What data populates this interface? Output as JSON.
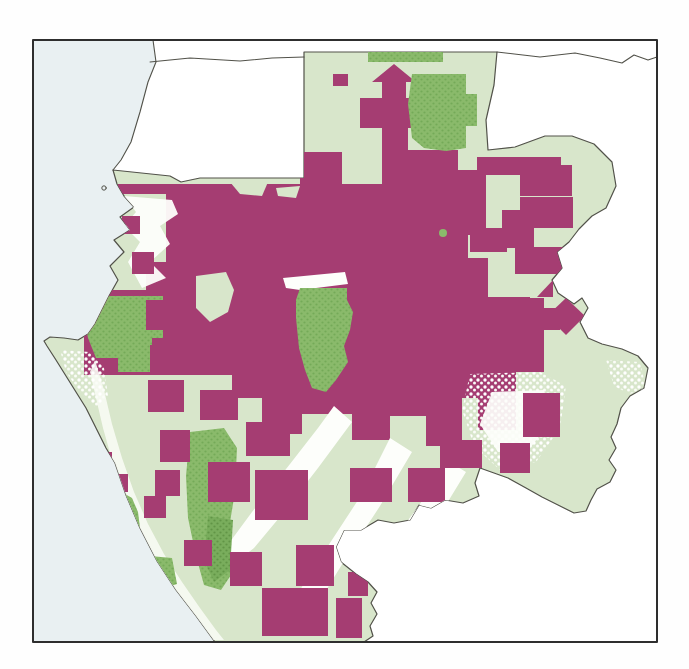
{
  "map": {
    "palette": {
      "page_background": "#fefefe",
      "ocean": "#e9f0f2",
      "neighbor_land": "#ffffff",
      "country_fill": "#d8e6cb",
      "concession_magenta": "#a53d72",
      "protected_green": "#8aba6b",
      "protected_green_dark": "#6fa356",
      "savanna_white": "#fdfefb",
      "border_line": "#52524a",
      "frame_line": "#2e2e2e"
    },
    "frame": {
      "x": 33,
      "y": 40,
      "w": 624,
      "h": 602
    },
    "country_outline": "113,170 170,176 181,182 200,178 304,178 304,52 497,52 494,85 486,120 488,150 515,147 545,136 572,136 594,144 612,162 616,186 606,208 592,216 579,229 569,242 557,252 562,268 552,280 558,293 574,304 582,298 588,308 580,322 588,338 602,344 622,349 638,356 648,368 644,388 630,396 621,408 617,424 611,437 616,448 609,460 616,470 610,482 597,489 591,500 586,511 574,513 558,505 542,497 526,488 508,478 494,473 480,468 475,483 479,496 463,503 445,500 431,508 419,505 410,520 394,523 378,520 361,530 344,530 336,547 341,562 356,574 368,582 377,592 371,603 377,614 370,626 373,636 364,642 215,642 196,616 176,590 157,561 140,528 126,495 115,463 106,448 96,428 86,408 76,392 66,376 56,360 47,346 44,341 50,337 64,338 78,340 88,334 95,324 101,312 109,296 118,280 110,266 124,252 114,240 130,230 120,217 134,207 124,196 117,184",
    "layers": [
      {
        "name": "ocean",
        "group": "base",
        "kind": "polygon",
        "fill": "#e9f0f2",
        "pts": "33,40 657,40 657,642 33,642"
      },
      {
        "name": "equatorial-guinea-land",
        "group": "base",
        "kind": "polygon",
        "fill": "#ffffff",
        "pts": "153,40 156,62 148,82 140,112 131,142 121,160 113,170 170,176 181,182 200,178 304,178 304,40"
      },
      {
        "name": "congo-cameroon-land",
        "group": "base",
        "kind": "polygon",
        "fill": "#ffffff",
        "pts": "304,40 657,40 657,642 364,642 373,636 370,626 377,614 371,603 377,592 368,582 356,574 341,562 336,547 344,530 361,530 378,520 394,523 410,520 419,505 431,508 445,500 463,503 479,496 475,483 480,468 494,473 508,478 526,488 542,497 558,505 574,513 586,511 591,500 597,489 610,482 616,470 609,460 616,448 611,437 617,424 621,408 630,396 644,388 648,368 638,356 622,349 602,344 588,338 580,322 588,308 582,298 574,304 558,293 552,280 562,268 557,252 569,242 579,229 592,216 606,208 616,186 612,162 594,144 572,136 545,136 515,147 488,150 486,120 494,85 497,52 304,52"
      },
      {
        "name": "gabon-landmass",
        "group": "base",
        "kind": "outline-polygon",
        "fill": "#d8e6cb",
        "stroke": "#52524a",
        "sw": 1.2
      },
      {
        "name": "concession-main-block",
        "group": "land",
        "kind": "polygon",
        "fill": "#a53d72",
        "pts": "118,184 300,184 300,152 342,152 342,184 406,184 406,150 458,150 458,170 486,170 486,235 468,235 468,258 488,258 488,298 544,298 544,372 516,372 516,430 478,430 478,398 462,398 462,446 426,446 426,416 390,416 390,440 352,440 352,414 302,414 302,434 262,434 262,398 232,398 232,375 84,375 84,290 146,290 146,262 166,262 166,194 118,194"
      },
      {
        "name": "concession-arrow-block",
        "group": "land",
        "kind": "polygon",
        "fill": "#a53d72",
        "pts": "360,98 382,98 382,82 372,82 394,64 416,82 406,82 406,98 426,98 426,128 408,128 408,184 382,184 382,128 360,128"
      },
      {
        "name": "forest-gap-patch",
        "group": "land",
        "kind": "polygon",
        "fill": "#d8e6cb",
        "pts": "196,276 226,272 234,290 228,312 210,322 196,308"
      },
      {
        "name": "forest-gap-patch",
        "group": "land",
        "kind": "polygon",
        "fill": "#d8e6cb",
        "pts": "230,182 268,182 262,196 240,194"
      },
      {
        "name": "forest-gap-patch",
        "group": "land",
        "kind": "polygon",
        "fill": "#d8e6cb",
        "pts": "276,188 300,186 296,198 278,196"
      },
      {
        "name": "savanna-white-patch",
        "group": "land",
        "kind": "polygon",
        "fill": "#fdfefb",
        "opacity": 0.95,
        "pts": "124,196 172,200 178,214 160,226 170,244 150,262 166,278 142,288 128,262 140,242 124,226 136,212"
      },
      {
        "name": "savanna-white-patch",
        "group": "land",
        "kind": "polygon",
        "fill": "#f8fbf4",
        "opacity": 0.9,
        "pts": "95,360 104,390 112,424 122,458 134,492 148,524 164,554 182,582 200,608 216,630 224,640 210,640 192,614 172,587 153,556 137,524 123,492 112,460 103,428 96,398 90,372"
      },
      {
        "name": "savanna-white-patch",
        "group": "land",
        "kind": "polygon",
        "fill": "url(#patSpeck)",
        "pts": "60,350 90,352 104,368 108,396 96,408 80,392 66,372"
      },
      {
        "name": "savanna-white-band",
        "group": "land",
        "kind": "polygon",
        "fill": "#fdfefb",
        "pts": "334,406 352,422 318,468 284,512 254,548 236,562 224,550 252,512 290,464 318,428"
      },
      {
        "name": "savanna-white-band",
        "group": "land",
        "kind": "polygon",
        "fill": "#fdfefb",
        "pts": "390,438 412,452 380,506 346,558 320,600 300,590 328,546 362,494"
      },
      {
        "name": "savanna-white-band",
        "group": "land",
        "kind": "polygon",
        "fill": "#fdfefb",
        "pts": "446,460 466,472 438,518 410,552 392,542 420,504"
      },
      {
        "name": "savanna-white-patch",
        "group": "land",
        "kind": "polygon",
        "fill": "url(#patSpeck)",
        "pts": "470,374 540,372 566,386 560,428 536,462 500,470 474,446 462,410"
      },
      {
        "name": "savanna-white-patch",
        "group": "land",
        "kind": "polygon",
        "fill": "#fdfefb",
        "opacity": 0.92,
        "pts": "492,392 544,390 552,420 530,448 498,452 480,424"
      },
      {
        "name": "savanna-white-sliver",
        "group": "land",
        "kind": "polygon",
        "fill": "#fdfefb",
        "pts": "283,278 345,272 348,284 300,290 286,288"
      },
      {
        "name": "savanna-white-patch",
        "group": "land",
        "kind": "polygon",
        "fill": "url(#patSpeck)",
        "pts": "606,360 640,362 646,388 630,394 614,386"
      },
      {
        "name": "protected-area-northwest",
        "group": "land",
        "kind": "polygon",
        "fill": "url(#patGreen)",
        "pts": "84,296 163,296 163,345 150,345 150,372 118,372 118,358 96,358 88,338 84,318"
      },
      {
        "name": "protected-area-coastal",
        "group": "land",
        "kind": "polygon",
        "fill": "url(#patGreen)",
        "pts": "118,490 132,498 138,512 140,528 130,534 122,520 116,504"
      },
      {
        "name": "protected-area-coastal",
        "group": "land",
        "kind": "polygon",
        "fill": "url(#patGreen)",
        "pts": "150,556 172,558 177,584 158,590"
      },
      {
        "name": "protected-area-north",
        "group": "land",
        "kind": "polygon",
        "fill": "url(#patGreen)",
        "pts": "412,74 466,74 466,94 477,94 477,126 466,126 466,148 446,151 424,148 412,138 408,104"
      },
      {
        "name": "protected-area-north-strip",
        "group": "land",
        "kind": "polygon",
        "fill": "url(#patGreen)",
        "pts": "368,48 443,48 443,62 368,62"
      },
      {
        "name": "protected-area-center",
        "group": "land",
        "kind": "polygon",
        "fill": "url(#patGreen)",
        "pts": "300,288 347,288 347,300 353,312 350,330 344,346 348,362 336,380 326,392 312,388 305,370 299,348 296,318 296,300"
      },
      {
        "name": "protected-area-south",
        "group": "land",
        "kind": "polygon",
        "fill": "url(#patGreen)",
        "pts": "190,432 224,428 237,448 235,492 227,540 233,572 221,590 204,585 196,556 188,518 186,476"
      },
      {
        "name": "protected-area-south-core",
        "group": "land",
        "kind": "polygon",
        "fill": "url(#patGreenDk)",
        "pts": "208,516 233,520 230,570 214,582 204,560"
      },
      {
        "name": "protected-area-dot",
        "group": "land",
        "kind": "circle",
        "fill": "#8aba6b",
        "cx": 443,
        "cy": 233,
        "r": 4
      },
      {
        "name": "concession-block",
        "group": "land",
        "kind": "polygon",
        "fill": "#a53d72",
        "pts": "122,216 140,216 140,234 122,234"
      },
      {
        "name": "concession-block",
        "group": "land",
        "kind": "polygon",
        "fill": "#a53d72",
        "pts": "132,252 154,252 154,274 132,274"
      },
      {
        "name": "concession-block",
        "group": "land",
        "kind": "polygon",
        "fill": "#a53d72",
        "pts": "146,300 174,300 174,330 146,330"
      },
      {
        "name": "concession-block",
        "group": "land",
        "kind": "polygon",
        "fill": "#a53d72",
        "pts": "152,338 180,338 180,362 152,362"
      },
      {
        "name": "concession-block",
        "group": "land",
        "kind": "polygon",
        "fill": "#a53d72",
        "pts": "333,74 348,74 348,86 333,86"
      },
      {
        "name": "concession-block",
        "group": "land",
        "kind": "polygon",
        "fill": "#a53d72",
        "pts": "477,157 561,157 561,175 477,175"
      },
      {
        "name": "concession-block",
        "group": "land",
        "kind": "polygon",
        "fill": "#a53d72",
        "pts": "520,165 572,165 572,196 520,196"
      },
      {
        "name": "concession-block",
        "group": "land",
        "kind": "polygon",
        "fill": "#a53d72",
        "pts": "520,197 573,197 573,228 520,228"
      },
      {
        "name": "concession-block",
        "group": "land",
        "kind": "polygon",
        "fill": "#a53d72",
        "pts": "502,210 534,210 534,248 502,248"
      },
      {
        "name": "concession-block",
        "group": "land",
        "kind": "polygon",
        "fill": "#a53d72",
        "pts": "470,228 507,228 507,252 470,252"
      },
      {
        "name": "concession-block",
        "group": "land",
        "kind": "polygon",
        "fill": "#a53d72",
        "pts": "515,247 570,247 570,274 515,274"
      },
      {
        "name": "concession-block",
        "group": "land",
        "kind": "polygon",
        "fill": "#a53d72",
        "pts": "566,298 585,316 566,335 547,316"
      },
      {
        "name": "concession-block",
        "group": "land",
        "kind": "polygon",
        "fill": "#a53d72",
        "pts": "537,297 553,280 553,297"
      },
      {
        "name": "concession-block",
        "group": "land",
        "kind": "polygon",
        "fill": "#a53d72",
        "pts": "470,297 530,297 530,308 560,308 560,330 540,330 540,350 470,350"
      },
      {
        "name": "concession-block",
        "group": "land",
        "kind": "polygon",
        "fill": "#a53d72",
        "pts": "523,393 560,393 560,437 523,437"
      },
      {
        "name": "concession-block",
        "group": "land",
        "kind": "polygon",
        "fill": "#a53d72",
        "pts": "500,443 530,443 530,473 500,473"
      },
      {
        "name": "concession-block",
        "group": "land",
        "kind": "polygon",
        "fill": "#a53d72",
        "pts": "440,440 482,440 482,468 440,468"
      },
      {
        "name": "concession-block",
        "group": "land",
        "kind": "polygon",
        "fill": "#a53d72",
        "pts": "408,468 445,468 445,502 408,502"
      },
      {
        "name": "concession-block",
        "group": "land",
        "kind": "polygon",
        "fill": "#a53d72",
        "pts": "350,468 392,468 392,502 350,502"
      },
      {
        "name": "concession-block",
        "group": "land",
        "kind": "polygon",
        "fill": "#a53d72",
        "pts": "296,545 334,545 334,586 296,586"
      },
      {
        "name": "concession-block",
        "group": "land",
        "kind": "polygon",
        "fill": "#a53d72",
        "pts": "262,588 328,588 328,636 262,636"
      },
      {
        "name": "concession-block",
        "group": "land",
        "kind": "polygon",
        "fill": "#a53d72",
        "pts": "230,552 262,552 262,586 230,586"
      },
      {
        "name": "concession-block",
        "group": "land",
        "kind": "polygon",
        "fill": "#a53d72",
        "pts": "208,462 250,462 250,502 208,502"
      },
      {
        "name": "concession-block",
        "group": "land",
        "kind": "polygon",
        "fill": "#a53d72",
        "pts": "255,470 308,470 308,520 255,520"
      },
      {
        "name": "concession-block",
        "group": "land",
        "kind": "polygon",
        "fill": "#a53d72",
        "pts": "246,422 290,422 290,456 246,456"
      },
      {
        "name": "concession-block",
        "group": "land",
        "kind": "polygon",
        "fill": "#a53d72",
        "pts": "160,430 190,430 190,462 160,462"
      },
      {
        "name": "concession-block",
        "group": "land",
        "kind": "polygon",
        "fill": "#a53d72",
        "pts": "148,380 184,380 184,412 148,412"
      },
      {
        "name": "concession-block",
        "group": "land",
        "kind": "polygon",
        "fill": "#a53d72",
        "pts": "200,390 238,390 238,420 200,420"
      },
      {
        "name": "concession-block",
        "group": "land",
        "kind": "polygon",
        "fill": "#a53d72",
        "pts": "155,470 180,470 180,496 155,496"
      },
      {
        "name": "concession-block",
        "group": "land",
        "kind": "polygon",
        "fill": "#a53d72",
        "pts": "184,540 212,540 212,566 184,566"
      },
      {
        "name": "concession-block",
        "group": "land",
        "kind": "polygon",
        "fill": "#a53d72",
        "pts": "336,598 362,598 362,638 336,638"
      },
      {
        "name": "concession-block",
        "group": "land",
        "kind": "polygon",
        "fill": "#a53d72",
        "pts": "348,572 368,572 368,596 348,596"
      },
      {
        "name": "concession-block",
        "group": "land",
        "kind": "polygon",
        "fill": "#a53d72",
        "pts": "96,452 112,452 112,470 96,470"
      },
      {
        "name": "concession-block",
        "group": "land",
        "kind": "polygon",
        "fill": "#a53d72",
        "pts": "108,474 128,474 128,492 108,492"
      },
      {
        "name": "concession-block",
        "group": "land",
        "kind": "polygon",
        "fill": "#a53d72",
        "pts": "144,496 166,496 166,518 144,518"
      },
      {
        "name": "international-border-line",
        "group": "lines",
        "kind": "polyline",
        "stroke": "#52524a",
        "sw": 1.1,
        "pts": "150,62 190,58 240,61 272,58 304,57"
      },
      {
        "name": "international-border-line",
        "group": "lines",
        "kind": "polyline",
        "stroke": "#52524a",
        "sw": 1.1,
        "pts": "497,52 540,57 575,53 600,58 622,63 634,55 648,60 657,57"
      },
      {
        "name": "coastline",
        "group": "lines",
        "kind": "polyline",
        "stroke": "#52524a",
        "sw": 1.1,
        "pts": "153,40 156,62 148,82 140,112 131,142 121,160 113,170"
      },
      {
        "name": "island-dot",
        "group": "lines",
        "kind": "circle",
        "fill": "none",
        "stroke": "#52524a",
        "sw": 1,
        "cx": 104,
        "cy": 188,
        "r": 2.2
      },
      {
        "name": "map-frame",
        "group": "lines",
        "kind": "polygon",
        "fill": "none",
        "stroke": "#2e2e2e",
        "sw": 2,
        "pts": "33,40 657,40 657,642 33,642"
      }
    ]
  }
}
